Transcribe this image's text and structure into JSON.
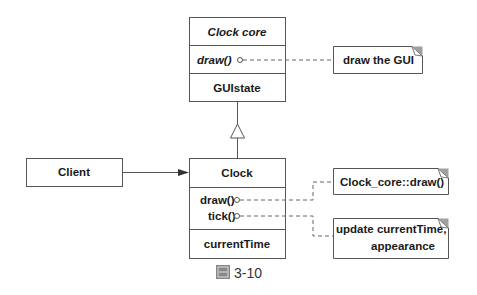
{
  "diagram": {
    "type": "UML class diagram",
    "classes": [
      {
        "id": "clock_core",
        "name": "Clock  core",
        "abstract": true,
        "operations": [
          "draw()"
        ],
        "attributes": [
          "GUIstate"
        ]
      },
      {
        "id": "clock",
        "name": "Clock",
        "abstract": false,
        "operations": [
          "draw()",
          "tick()"
        ],
        "attributes": [
          "currentTime"
        ]
      },
      {
        "id": "client",
        "name": "Client"
      }
    ],
    "notes": [
      {
        "id": "note_draw_gui",
        "lines": [
          "draw the GUI"
        ],
        "attached_to": "clock_core.draw()"
      },
      {
        "id": "note_clock_core_draw",
        "lines": [
          "Clock_core::draw()"
        ],
        "attached_to": "clock.draw()"
      },
      {
        "id": "note_update",
        "lines": [
          "update currentTime,",
          "appearance"
        ],
        "attached_to": "clock.tick()"
      }
    ],
    "relations": [
      {
        "type": "generalization",
        "from": "clock",
        "to": "clock_core"
      },
      {
        "type": "association",
        "from": "client",
        "to": "clock",
        "arrow": "filled"
      }
    ],
    "colors": {
      "line": "#555555",
      "text": "#1a1a1a",
      "note_corner": "#a0a0a0"
    }
  },
  "caption": {
    "icon": "figure-icon",
    "text": "3-10"
  }
}
